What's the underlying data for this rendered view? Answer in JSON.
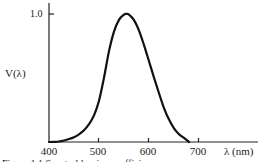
{
  "chart_data": {
    "type": "line",
    "title": "",
    "xlabel": "λ (nm)",
    "ylabel": "V(λ)",
    "xlim": [
      400,
      760
    ],
    "ylim": [
      0,
      1.0
    ],
    "x_ticks": [
      400,
      500,
      600,
      700
    ],
    "y_ticks": [
      1.0
    ],
    "y_tick_labels": [
      "1.0"
    ],
    "grid": false,
    "legend": null,
    "series": [
      {
        "name": "V(λ)",
        "x": [
          400,
          410,
          420,
          430,
          440,
          450,
          460,
          470,
          480,
          490,
          500,
          510,
          520,
          530,
          540,
          550,
          555,
          560,
          570,
          580,
          590,
          600,
          610,
          620,
          630,
          640,
          650,
          660,
          670,
          680
        ],
        "values": [
          0.0,
          0.001,
          0.004,
          0.012,
          0.023,
          0.038,
          0.06,
          0.091,
          0.139,
          0.208,
          0.323,
          0.503,
          0.71,
          0.862,
          0.954,
          0.995,
          1.0,
          0.995,
          0.952,
          0.87,
          0.757,
          0.631,
          0.503,
          0.381,
          0.265,
          0.175,
          0.107,
          0.061,
          0.032,
          0.0
        ]
      }
    ]
  },
  "axes": {
    "y_label": "V(λ)",
    "y_tick_label": "1.0",
    "x_unit_label": "λ (nm)",
    "x_tick_labels": [
      "400",
      "500",
      "600",
      "700"
    ]
  },
  "caption": "Figure 1.1   Spectral luminous efficiency..."
}
